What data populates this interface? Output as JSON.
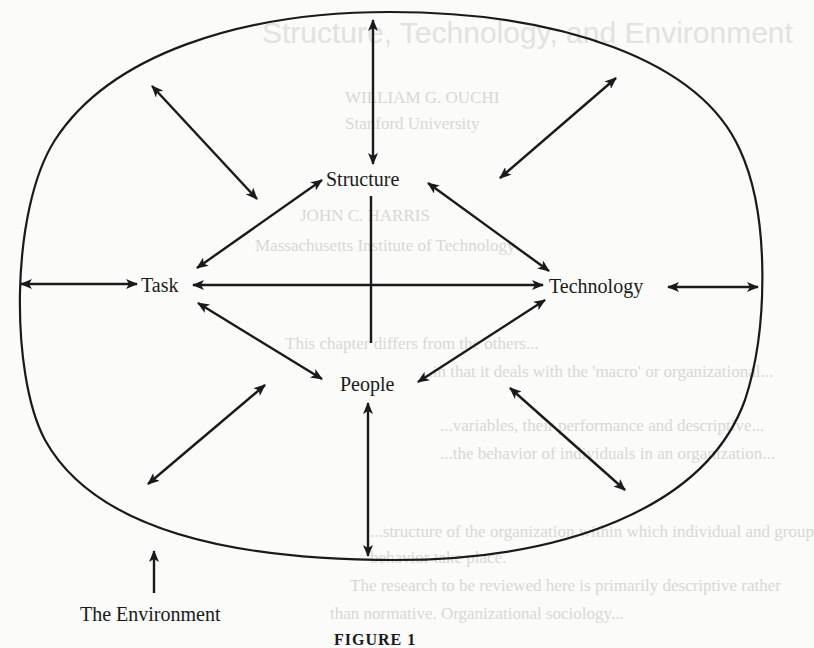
{
  "diagram": {
    "nodes": [
      {
        "id": "structure",
        "label": "Structure"
      },
      {
        "id": "task",
        "label": "Task"
      },
      {
        "id": "technology",
        "label": "Technology"
      },
      {
        "id": "people",
        "label": "People"
      }
    ],
    "environment_label": "The Environment",
    "caption": "FIGURE 1",
    "edges": [
      {
        "from": "structure",
        "to": "task",
        "type": "bidirectional"
      },
      {
        "from": "structure",
        "to": "technology",
        "type": "bidirectional"
      },
      {
        "from": "task",
        "to": "people",
        "type": "bidirectional"
      },
      {
        "from": "technology",
        "to": "people",
        "type": "bidirectional"
      },
      {
        "from": "task",
        "to": "technology",
        "type": "bidirectional"
      },
      {
        "from": "structure",
        "to": "people",
        "type": "line-crossing"
      },
      {
        "from": "structure",
        "to": "environment",
        "type": "bidirectional"
      },
      {
        "from": "task",
        "to": "environment",
        "type": "bidirectional"
      },
      {
        "from": "technology",
        "to": "environment",
        "type": "bidirectional"
      },
      {
        "from": "people",
        "to": "environment",
        "type": "bidirectional"
      },
      {
        "from": "environment-upper-left",
        "to": "center",
        "type": "bidirectional"
      },
      {
        "from": "environment-upper-right",
        "to": "center",
        "type": "bidirectional"
      },
      {
        "from": "environment-lower-left",
        "to": "center",
        "type": "bidirectional"
      },
      {
        "from": "environment-lower-right",
        "to": "center",
        "type": "bidirectional"
      }
    ],
    "colors": {
      "ink": "#1a1a1a",
      "paper": "#fbfbf9",
      "bleed_through": "#d8d8d4"
    }
  },
  "bleed_through": {
    "title": "Structure, Technology, and Environment",
    "lines": [
      "WILLIAM G. OUCHI",
      "Stanford University",
      "JOHN C. HARRIS",
      "Massachusetts Institute of Technology",
      "This chapter differs from the others...",
      "...in that it deals with the 'macro' or organizational...",
      "...variables, their performance and descriptive...",
      "...the behavior of individuals in an organization...",
      "...structure of the organization within which individual and group",
      "behavior take place.",
      "The research to be reviewed here is primarily descriptive rather",
      "than normative. Organizational sociology..."
    ]
  }
}
